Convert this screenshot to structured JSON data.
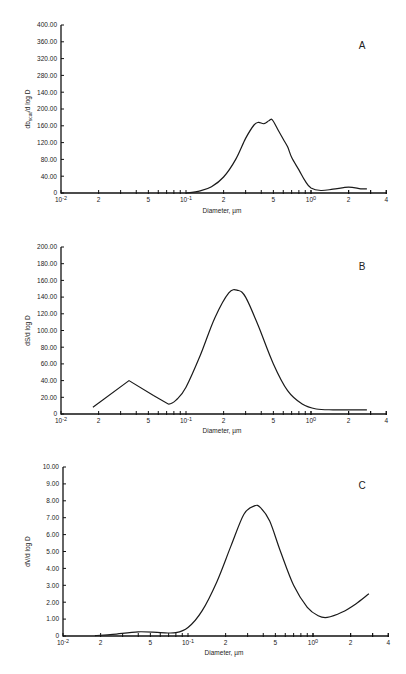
{
  "chart_data": [
    {
      "type": "line",
      "panel": "A",
      "title": "",
      "xlabel": "Diameter, µm",
      "ylabel": "db_scat/d log D",
      "xscale": "log",
      "xlim": [
        0.01,
        4
      ],
      "ylim": [
        0,
        400
      ],
      "y_tick_labels": [
        "0",
        "40.00",
        "80.00",
        "120.00",
        "160.00",
        "200.00",
        "140.00",
        "280.00",
        "320.00",
        "360.00",
        "400.00"
      ],
      "x_tick_labels": [
        "10-2",
        "2",
        "5",
        "10-1",
        "2",
        "5",
        "100",
        "2",
        "4"
      ],
      "grid": false,
      "series": [
        {
          "name": "A",
          "x": [
            0.1,
            0.13,
            0.16,
            0.2,
            0.25,
            0.3,
            0.35,
            0.38,
            0.42,
            0.46,
            0.49,
            0.55,
            0.6,
            0.65,
            0.7,
            0.8,
            0.9,
            1.0,
            1.2,
            1.5,
            2.0,
            2.5,
            2.8
          ],
          "values": [
            0,
            5,
            15,
            38,
            80,
            130,
            162,
            168,
            165,
            172,
            174,
            148,
            128,
            110,
            85,
            55,
            28,
            12,
            6,
            9,
            14,
            10,
            10
          ]
        }
      ]
    },
    {
      "type": "line",
      "panel": "B",
      "title": "",
      "xlabel": "Diameter, µm",
      "ylabel": "dS/d log D",
      "xscale": "log",
      "xlim": [
        0.01,
        4
      ],
      "ylim": [
        0,
        200
      ],
      "y_tick_labels": [
        "0",
        "20.00",
        "40.00",
        "60.00",
        "80.00",
        "100.00",
        "120.00",
        "140.00",
        "160.00",
        "180.00",
        "200.00"
      ],
      "x_tick_labels": [
        "10-2",
        "2",
        "5",
        "10-1",
        "2",
        "5",
        "100",
        "2",
        "4"
      ],
      "grid": false,
      "series": [
        {
          "name": "B",
          "x": [
            0.018,
            0.035,
            0.055,
            0.072,
            0.085,
            0.1,
            0.13,
            0.17,
            0.22,
            0.26,
            0.3,
            0.38,
            0.5,
            0.65,
            0.85,
            1.1,
            1.5,
            2.0,
            2.8
          ],
          "values": [
            8,
            40,
            22,
            12,
            18,
            32,
            70,
            115,
            145,
            148,
            140,
            105,
            60,
            28,
            12,
            6,
            5,
            5,
            5
          ]
        }
      ]
    },
    {
      "type": "line",
      "panel": "C",
      "title": "",
      "xlabel": "Diameter, µm",
      "ylabel": "dV/d log D",
      "xscale": "log",
      "xlim": [
        0.01,
        4
      ],
      "ylim": [
        0,
        10
      ],
      "y_tick_labels": [
        "0",
        "1.00",
        "2.00",
        "3.00",
        "4.00",
        "5.00",
        "6.00",
        "7.00",
        "8.00",
        "9.00",
        "10.00"
      ],
      "x_tick_labels": [
        "10-2",
        "2",
        "5",
        "10-1",
        "2",
        "5",
        "100",
        "2",
        "4"
      ],
      "grid": false,
      "series": [
        {
          "name": "C",
          "x": [
            0.018,
            0.025,
            0.04,
            0.06,
            0.08,
            0.1,
            0.13,
            0.17,
            0.22,
            0.28,
            0.34,
            0.38,
            0.45,
            0.55,
            0.7,
            0.9,
            1.1,
            1.3,
            1.7,
            2.2,
            2.8
          ],
          "values": [
            0.02,
            0.1,
            0.25,
            0.2,
            0.2,
            0.5,
            1.5,
            3.2,
            5.3,
            7.2,
            7.7,
            7.6,
            6.8,
            5.0,
            3.0,
            1.7,
            1.2,
            1.1,
            1.4,
            1.9,
            2.5
          ]
        }
      ]
    }
  ],
  "panels": {
    "A": {
      "letter": "A",
      "ylabel_main": "db",
      "ylabel_sub": "scat",
      "ylabel_rest": "/d log D",
      "xlabel": "Diameter, µm"
    },
    "B": {
      "letter": "B",
      "ylabel": "dS/d log D",
      "xlabel": "Diameter, µm"
    },
    "C": {
      "letter": "C",
      "ylabel": "dV/d log D",
      "xlabel": "Diameter, µm"
    }
  }
}
